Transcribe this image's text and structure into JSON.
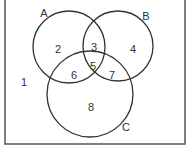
{
  "diagram": {
    "type": "venn",
    "sets": [
      {
        "name": "A",
        "cx": 69,
        "cy": 47,
        "r": 36,
        "label_x": 44,
        "label_y": 17
      },
      {
        "name": "B",
        "cx": 118,
        "cy": 46,
        "r": 35,
        "label_x": 146,
        "label_y": 20
      },
      {
        "name": "C",
        "cx": 90,
        "cy": 94,
        "r": 43,
        "label_x": 126,
        "label_y": 131
      }
    ],
    "regions": [
      {
        "id": "1",
        "x": 24,
        "y": 82
      },
      {
        "id": "2",
        "x": 58,
        "y": 49
      },
      {
        "id": "3",
        "x": 94,
        "y": 47
      },
      {
        "id": "4",
        "x": 133,
        "y": 49
      },
      {
        "id": "5",
        "x": 93,
        "y": 66
      },
      {
        "id": "6",
        "x": 74,
        "y": 75
      },
      {
        "id": "7",
        "x": 112,
        "y": 75
      },
      {
        "id": "8",
        "x": 91,
        "y": 107
      }
    ],
    "stroke_color": "#333333",
    "frame_color": "#555555"
  }
}
